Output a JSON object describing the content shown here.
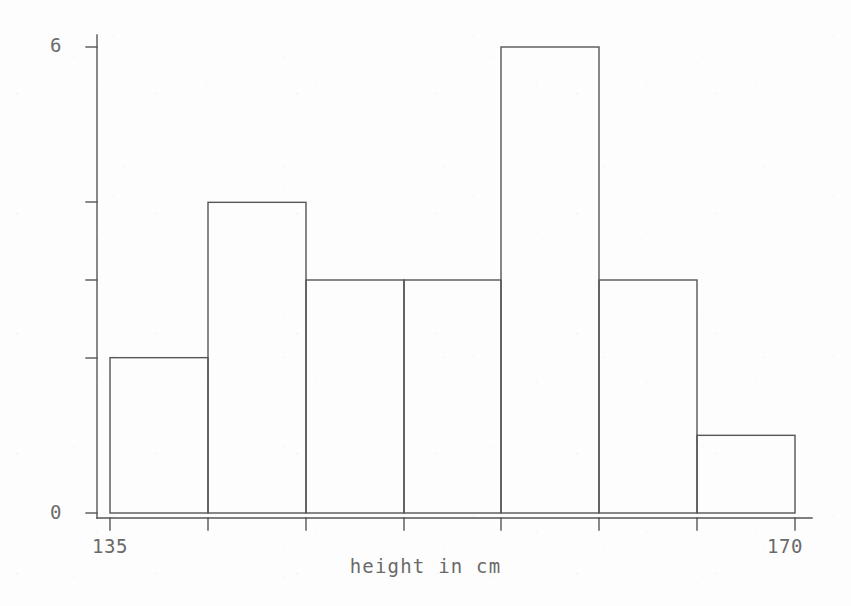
{
  "chart_data": {
    "type": "bar",
    "title": "",
    "subtitle": "",
    "xlabel": "height in cm",
    "ylabel": "",
    "categories": [
      "135-140",
      "140-145",
      "145-150",
      "150-155",
      "155-160",
      "160-165",
      "165-170"
    ],
    "bin_edges": [
      135,
      140,
      145,
      150,
      155,
      160,
      165,
      170
    ],
    "values": [
      2,
      4,
      3,
      3,
      6,
      3,
      1
    ],
    "xlim": [
      135,
      170
    ],
    "ylim": [
      0,
      6
    ],
    "x_tick_labels": [
      "135",
      "170"
    ],
    "x_tick_values": [
      135,
      170
    ],
    "x_minor_ticks": [
      140,
      145,
      150,
      155,
      160,
      165
    ],
    "y_tick_labels": [
      "0",
      "6"
    ],
    "y_tick_values": [
      0,
      6
    ],
    "y_minor_ticks": [
      2,
      3,
      4
    ],
    "grid": false,
    "legend": false,
    "legend_position": "none",
    "annotations": []
  },
  "axes": {
    "y_top_label": "6",
    "y_bottom_label": "0",
    "x_left_label": "135",
    "x_right_label": "170",
    "x_axis_title": "height in cm"
  },
  "style": {
    "background": "#fdfdfd",
    "line_color": "#555555",
    "text_color": "#6a6a6a",
    "bar_fill": "none",
    "bar_stroke": "#555555"
  }
}
